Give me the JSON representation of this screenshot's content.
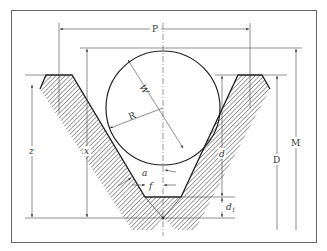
{
  "diagram": {
    "colors": {
      "line": "#333333",
      "frame": "#555555",
      "hatch": "#444444",
      "background": "#ffffff"
    },
    "labels": {
      "pitch": "P",
      "wire_diameter": "W",
      "wire_radius": "R",
      "half_angle": "a",
      "flat": "f",
      "depth": "d",
      "depth_root": "d",
      "depth_root_sub": "1",
      "outside_diameter": "D",
      "measurement_over_wires": "M",
      "height_z": "z",
      "height_x": "x"
    }
  }
}
